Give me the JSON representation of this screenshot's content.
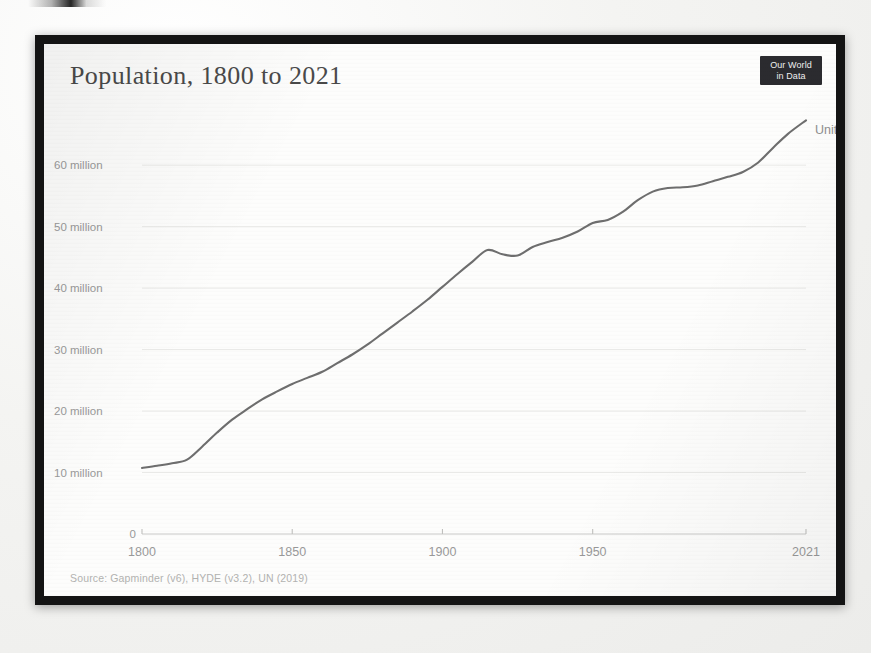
{
  "page": {
    "background_color": "#f2f2f0",
    "frame_color": "#141414"
  },
  "header": {
    "title": "Population, 1800 to 2021",
    "logo_line1": "Our World",
    "logo_line2": "in Data"
  },
  "footer": {
    "source": "Source: Gapminder (v6), HYDE (v3.2), UN (2019)"
  },
  "series_label": "United Kingdom",
  "colors": {
    "line": "#6e6e6e",
    "gridline": "#e9e9e7",
    "tick_label": "#9a9a9a",
    "title": "#4a4a4a",
    "source": "#b2b2b0",
    "logo_bg": "#2b2b2f"
  },
  "chart_data": {
    "type": "line",
    "title": "Population, 1800 to 2021",
    "xlabel": "",
    "ylabel": "",
    "xlim": [
      1800,
      2021
    ],
    "ylim": [
      0,
      68000000
    ],
    "grid": true,
    "legend_position": "line-end-label",
    "xticks": [
      1800,
      1850,
      1900,
      1950,
      2021
    ],
    "xtick_labels": [
      "1800",
      "1850",
      "1900",
      "1950",
      "2021"
    ],
    "yticks": [
      0,
      10000000,
      20000000,
      30000000,
      40000000,
      50000000,
      60000000
    ],
    "ytick_labels": [
      "0",
      "10 million",
      "20 million",
      "30 million",
      "40 million",
      "50 million",
      "60 million"
    ],
    "annotations": [
      "United Kingdom"
    ],
    "series": [
      {
        "name": "United Kingdom",
        "color": "#6e6e6e",
        "x": [
          1800,
          1805,
          1810,
          1815,
          1820,
          1825,
          1830,
          1835,
          1840,
          1845,
          1850,
          1855,
          1860,
          1865,
          1870,
          1875,
          1880,
          1885,
          1890,
          1895,
          1900,
          1905,
          1910,
          1915,
          1920,
          1925,
          1930,
          1935,
          1940,
          1945,
          1950,
          1955,
          1960,
          1965,
          1970,
          1975,
          1980,
          1985,
          1990,
          1995,
          2000,
          2005,
          2010,
          2015,
          2021
        ],
        "values": [
          10750000,
          11100000,
          11500000,
          12100000,
          14200000,
          16500000,
          18600000,
          20300000,
          21900000,
          23200000,
          24400000,
          25400000,
          26400000,
          27800000,
          29200000,
          30800000,
          32600000,
          34400000,
          36200000,
          38100000,
          40200000,
          42300000,
          44300000,
          46200000,
          45500000,
          45300000,
          46700000,
          47500000,
          48200000,
          49200000,
          50600000,
          51100000,
          52400000,
          54300000,
          55700000,
          56300000,
          56400000,
          56700000,
          57400000,
          58100000,
          58900000,
          60400000,
          62800000,
          65100000,
          67300000
        ]
      }
    ]
  }
}
